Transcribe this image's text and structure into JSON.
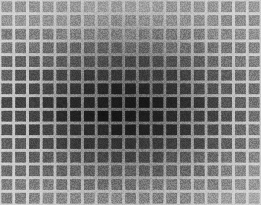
{
  "image": {
    "title": "Scintillating grid brightness-gradient illusion",
    "width": 261,
    "height": 205,
    "background_color": "#b9b9b9"
  },
  "grid": {
    "columns": 19,
    "rows": 15,
    "cell_pitch_x": 13.74,
    "cell_pitch_y": 13.67,
    "cell_gap": 3.1,
    "cell_corner_radius": 0.6,
    "line_color_edge": "#cfcfcf",
    "line_color_center": "#7d7d7d"
  },
  "gradient": {
    "type": "radial",
    "center_x": 130,
    "center_y": 105,
    "radius_x": 150,
    "radius_y": 128,
    "darkest_color": "#242424",
    "mid_color": "#4e4e4e",
    "lightest_color": "#9b9b9b",
    "corner_color": "#a6a6a6"
  },
  "texture": {
    "name": "film-grain",
    "opacity": 0.3,
    "grain_scale": 1.0
  },
  "chart_data": {
    "type": "heatmap",
    "xlabel": "",
    "ylabel": "",
    "columns": 19,
    "rows": 15,
    "value_min": 34,
    "value_max": 166,
    "values": [
      [
        150,
        152,
        154,
        155,
        156,
        157,
        158,
        158,
        158,
        158,
        158,
        157,
        156,
        155,
        154,
        152,
        150,
        150,
        152
      ],
      [
        142,
        144,
        146,
        147,
        148,
        149,
        150,
        150,
        150,
        150,
        150,
        149,
        148,
        147,
        146,
        144,
        142,
        143,
        146
      ],
      [
        130,
        131,
        132,
        133,
        133,
        133,
        133,
        133,
        132,
        132,
        132,
        133,
        133,
        133,
        134,
        135,
        136,
        139,
        143
      ],
      [
        116,
        116,
        116,
        115,
        114,
        113,
        111,
        110,
        109,
        109,
        110,
        111,
        113,
        115,
        117,
        120,
        124,
        129,
        136
      ],
      [
        103,
        102,
        100,
        98,
        95,
        92,
        89,
        87,
        86,
        86,
        87,
        89,
        92,
        96,
        100,
        105,
        111,
        119,
        128
      ],
      [
        92,
        90,
        87,
        83,
        79,
        74,
        70,
        67,
        65,
        65,
        67,
        70,
        74,
        80,
        86,
        93,
        101,
        111,
        122
      ],
      [
        83,
        80,
        76,
        71,
        65,
        59,
        53,
        49,
        47,
        47,
        49,
        53,
        59,
        66,
        74,
        83,
        93,
        105,
        117
      ],
      [
        78,
        74,
        69,
        63,
        56,
        48,
        41,
        37,
        35,
        35,
        37,
        41,
        48,
        57,
        66,
        77,
        88,
        101,
        114
      ],
      [
        78,
        74,
        69,
        62,
        55,
        47,
        40,
        35,
        34,
        34,
        36,
        40,
        47,
        56,
        66,
        77,
        88,
        101,
        114
      ],
      [
        82,
        79,
        74,
        68,
        62,
        55,
        49,
        45,
        43,
        43,
        45,
        49,
        55,
        63,
        72,
        82,
        93,
        105,
        117
      ],
      [
        90,
        88,
        84,
        80,
        75,
        70,
        65,
        62,
        60,
        61,
        63,
        66,
        71,
        78,
        85,
        94,
        103,
        114,
        125
      ],
      [
        100,
        99,
        96,
        93,
        90,
        86,
        83,
        80,
        79,
        80,
        81,
        84,
        88,
        93,
        100,
        107,
        115,
        125,
        135
      ],
      [
        111,
        110,
        109,
        107,
        105,
        103,
        101,
        99,
        99,
        99,
        100,
        102,
        105,
        109,
        114,
        120,
        127,
        136,
        145
      ],
      [
        122,
        122,
        122,
        121,
        120,
        119,
        118,
        117,
        117,
        117,
        118,
        120,
        122,
        125,
        129,
        134,
        140,
        147,
        155
      ],
      [
        132,
        133,
        134,
        134,
        134,
        134,
        134,
        134,
        134,
        134,
        135,
        136,
        138,
        140,
        143,
        147,
        152,
        158,
        166
      ]
    ]
  }
}
